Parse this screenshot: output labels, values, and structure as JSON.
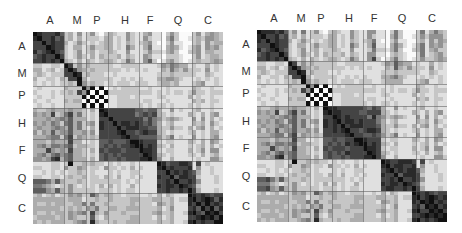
{
  "chart_data": [
    {
      "type": "heatmap",
      "title": "",
      "colormap": "grayscale (white = low, black = high)",
      "groups": [
        "A",
        "M",
        "P",
        "H",
        "F",
        "Q",
        "C"
      ],
      "group_sizes": [
        7,
        5,
        5,
        7,
        5,
        7,
        7
      ],
      "x_tick_labels": [
        "A",
        "M",
        "P",
        "H",
        "F",
        "Q",
        "C"
      ],
      "y_tick_labels": [
        "A",
        "M",
        "P",
        "H",
        "F",
        "Q",
        "C"
      ],
      "grid_separators": true,
      "matrix_rows": [
        "9877786231412410232114211341102420002413432",
        "8977867231312221331214211421103520012324432",
        "7797877312421212331213212341002411002314233",
        "7779877213312422331215311351103431013414342",
        "8678976212412312232114111242213420023413322",
        "6787797212421313222313211431102221002412332",
        "7787879321313212332125311462013421012322343",
        "2211221972423222221122221111243543312113121",
        "3312312797432322222212121211132532422214121",
        "2321222779823222112111111111222322222113211",
        "3112213277931222221121212111334432111212121",
        "2121212232942322121222122211233231112341121",
        "1211111322294909012122221121112111113211211",
        "2111212232749090922222222221212122124221222",
        "1211211222290909011222121111221111131211211",
        "2112111323309090911222221221112111113231221",
        "1211211222290909011222222121221211121211211",
        "3223433343321319877777766566311412112311211",
        "4343723573521218977777756767321211132131341",
        "3334345463331217797777777575423432114141312",
        "4343542563523418779788787675312311113231421",
        "3433454363521318777978887766322422131341312",
        "4243634463342417777897767877321211123121331",
        "3334552572432327777789776666423512114121341",
        "3332433373311216676667998777212211132131431",
        "3453554562332216767677899787321311121231312",
        "3337434373321317677767779887212211131241441",
        "3453564563321216767677777987321211122131231",
        "4434783563331316766767778897411311111211442",
        "1111221292232322121211211111986778871712111",
        "2211221422431221422121312111897877781411211",
        "1121212122321211121211221111779787876311211",
        "2211221232231221321311212111877968877211121",
        "6665363222321222222212121111778797787411121",
        "5543212242121213131211311111878879876211111",
        "6664363242222212221212211111778778797311121",
        "2312312243422642332212221121313211198787677",
        "3333333233312232232222332223322312289789868",
        "3223233223352522322222322221432311187979787",
        "3333332232324352233223332222312411178697968",
        "3223233243452732422232222223422311289769897",
        "2333323243222621322222332221312311177898979",
        "3232333223452832223223332222322311289787799"
      ]
    },
    {
      "type": "heatmap",
      "title": "",
      "colormap": "grayscale (white = low, black = high)",
      "groups": [
        "A",
        "M",
        "P",
        "H",
        "F",
        "Q",
        "C"
      ],
      "group_sizes": [
        7,
        5,
        5,
        7,
        5,
        7,
        7
      ],
      "x_tick_labels": [
        "A",
        "M",
        "P",
        "H",
        "F",
        "Q",
        "C"
      ],
      "y_tick_labels": [
        "A",
        "M",
        "P",
        "H",
        "F",
        "Q",
        "C"
      ],
      "grid_separators": true,
      "matrix_rows": [
        "9888786241512410232114211441102520002513532",
        "8977867231312221331214211421103520012424442",
        "8797877312421212331213212351002411002314243",
        "7779877213312422331215311361103531013514342",
        "8678976212412312232114111252213520023513422",
        "6787797212421313222313211441102321002512342",
        "7787879321313212332125311472013521012422343",
        "2211221972423222221122221111243643312113121",
        "3312312797432322222212121211132632422214121",
        "2321222779823222112111111111222322222113211",
        "3112213277931222221121212111334532111212121",
        "2121212232942322121222122211233331112341121",
        "1211111322294909012122221121112111113211211",
        "2111212232749090922222222221212122124221222",
        "1211211222290909011222121111221111131211211",
        "2112111323309090911222221221112111113231221",
        "1211211222290909011222222121221211121211211",
        "3223433343321319887777776576311412112311211",
        "4343723573521218988777766777321211132131341",
        "3334345463331217798787777585423432114141312",
        "4343542563523418789788787775312311113231421",
        "3433454363521318787978887776322422131341312",
        "4243634463342417787897767887321211123121331",
        "3334552572432327777789776676423512114121341",
        "3332433373311216676677998777212211132131431",
        "3453554562332216767687899787321311121231312",
        "3337434373321317677767779887212211131241441",
        "3453564563321216767687777987321211122131231",
        "4434783563331316766767778897411311111211442",
        "1111221292232322121211211111987788871712111",
        "2211221422431221422121312111897887781411211",
        "1121212122321211121211221111789787886311211",
        "2211221232231221321311212111877968887211121",
        "6675363222321222222212121111778797787411121",
        "5553212242121213131211311111878879876211111",
        "6674363242222212221212211111788778797311121",
        "2312312243422642332212221121313211198787677",
        "3333333233312232232222332223322312289789878",
        "3223233223352522322222322221432311187989787",
        "3333332232324352233223332222312411178698978",
        "3223233243452732422232222223422311289779897",
        "2333323243222621322222332221312311177898989",
        "3232333223452832223223332222322311289787899"
      ]
    }
  ],
  "panels": [
    {
      "col_labels": [
        {
          "text": "A",
          "x": 50
        },
        {
          "text": "M",
          "x": 77
        },
        {
          "text": "P",
          "x": 97
        },
        {
          "text": "H",
          "x": 125
        },
        {
          "text": "F",
          "x": 150
        },
        {
          "text": "Q",
          "x": 178
        },
        {
          "text": "C",
          "x": 208
        }
      ],
      "row_labels": [
        {
          "text": "A",
          "y": 46
        },
        {
          "text": "M",
          "y": 73
        },
        {
          "text": "P",
          "y": 95
        },
        {
          "text": "H",
          "y": 123
        },
        {
          "text": "F",
          "y": 150
        },
        {
          "text": "Q",
          "y": 178
        },
        {
          "text": "C",
          "y": 208
        }
      ]
    },
    {
      "col_labels": [
        {
          "text": "A",
          "x": 50
        },
        {
          "text": "M",
          "x": 77
        },
        {
          "text": "P",
          "x": 97
        },
        {
          "text": "H",
          "x": 125
        },
        {
          "text": "F",
          "x": 150
        },
        {
          "text": "Q",
          "x": 178
        },
        {
          "text": "C",
          "x": 208
        }
      ],
      "row_labels": [
        {
          "text": "A",
          "y": 44
        },
        {
          "text": "M",
          "y": 71
        },
        {
          "text": "P",
          "y": 93
        },
        {
          "text": "H",
          "y": 121
        },
        {
          "text": "F",
          "y": 148
        },
        {
          "text": "Q",
          "y": 176
        },
        {
          "text": "C",
          "y": 206
        }
      ]
    }
  ]
}
